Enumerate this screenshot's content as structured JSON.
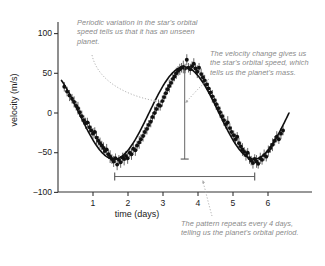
{
  "chart_data": {
    "type": "scatter",
    "title": "",
    "xlabel": "time (days)",
    "ylabel": "velocity (m/s)",
    "xlim": [
      0.1,
      6.6
    ],
    "ylim": [
      -100,
      115
    ],
    "xticks": [
      1,
      2,
      3,
      4,
      5,
      6
    ],
    "yticks": [
      100,
      50,
      0,
      -50,
      -100
    ],
    "xticklabels": [
      "1",
      "2",
      "3",
      "4",
      "5",
      "6"
    ],
    "yticklabels": [
      "100",
      "50",
      "0",
      "−50",
      "−100"
    ],
    "grid": false,
    "legend": null,
    "series": [
      {
        "name": "radial velocity measurements",
        "marker": "filled-circle-with-errorbars",
        "color": "#111111",
        "points": [
          {
            "x": 0.18,
            "y": 33,
            "err": 6
          },
          {
            "x": 0.26,
            "y": 27,
            "err": 6
          },
          {
            "x": 0.33,
            "y": 22,
            "err": 7
          },
          {
            "x": 0.4,
            "y": 18,
            "err": 6
          },
          {
            "x": 0.46,
            "y": 14,
            "err": 7
          },
          {
            "x": 0.52,
            "y": 9,
            "err": 6
          },
          {
            "x": 0.57,
            "y": 6,
            "err": 8
          },
          {
            "x": 0.62,
            "y": 1,
            "err": 6
          },
          {
            "x": 0.68,
            "y": -4,
            "err": 7
          },
          {
            "x": 0.74,
            "y": -9,
            "err": 6
          },
          {
            "x": 0.79,
            "y": -13,
            "err": 7
          },
          {
            "x": 0.84,
            "y": -12,
            "err": 6
          },
          {
            "x": 0.9,
            "y": -18,
            "err": 7
          },
          {
            "x": 0.95,
            "y": -22,
            "err": 6
          },
          {
            "x": 1.0,
            "y": -26,
            "err": 7
          },
          {
            "x": 1.05,
            "y": -24,
            "err": 6
          },
          {
            "x": 1.1,
            "y": -31,
            "err": 8
          },
          {
            "x": 1.15,
            "y": -35,
            "err": 6
          },
          {
            "x": 1.2,
            "y": -38,
            "err": 7
          },
          {
            "x": 1.25,
            "y": -41,
            "err": 6
          },
          {
            "x": 1.3,
            "y": -44,
            "err": 7
          },
          {
            "x": 1.34,
            "y": -48,
            "err": 6
          },
          {
            "x": 1.39,
            "y": -46,
            "err": 7
          },
          {
            "x": 1.44,
            "y": -52,
            "err": 6
          },
          {
            "x": 1.49,
            "y": -55,
            "err": 8
          },
          {
            "x": 1.54,
            "y": -58,
            "err": 6
          },
          {
            "x": 1.59,
            "y": -61,
            "err": 7
          },
          {
            "x": 1.64,
            "y": -57,
            "err": 6
          },
          {
            "x": 1.69,
            "y": -65,
            "err": 7
          },
          {
            "x": 1.74,
            "y": -59,
            "err": 6
          },
          {
            "x": 1.79,
            "y": -62,
            "err": 7
          },
          {
            "x": 1.84,
            "y": -56,
            "err": 6
          },
          {
            "x": 1.89,
            "y": -58,
            "err": 8
          },
          {
            "x": 1.94,
            "y": -54,
            "err": 6
          },
          {
            "x": 1.99,
            "y": -57,
            "err": 7
          },
          {
            "x": 2.05,
            "y": -50,
            "err": 6
          },
          {
            "x": 2.1,
            "y": -52,
            "err": 7
          },
          {
            "x": 2.15,
            "y": -45,
            "err": 6
          },
          {
            "x": 2.21,
            "y": -47,
            "err": 7
          },
          {
            "x": 2.26,
            "y": -41,
            "err": 6
          },
          {
            "x": 2.32,
            "y": -37,
            "err": 8
          },
          {
            "x": 2.37,
            "y": -33,
            "err": 6
          },
          {
            "x": 2.43,
            "y": -29,
            "err": 7
          },
          {
            "x": 2.48,
            "y": -24,
            "err": 6
          },
          {
            "x": 2.54,
            "y": -20,
            "err": 7
          },
          {
            "x": 2.59,
            "y": -15,
            "err": 6
          },
          {
            "x": 2.65,
            "y": -11,
            "err": 7
          },
          {
            "x": 2.7,
            "y": -5,
            "err": 6
          },
          {
            "x": 2.76,
            "y": 0,
            "err": 8
          },
          {
            "x": 2.81,
            "y": 5,
            "err": 6
          },
          {
            "x": 2.87,
            "y": 10,
            "err": 7
          },
          {
            "x": 2.92,
            "y": 9,
            "err": 6
          },
          {
            "x": 2.98,
            "y": 15,
            "err": 7
          },
          {
            "x": 3.03,
            "y": 20,
            "err": 6
          },
          {
            "x": 3.08,
            "y": 25,
            "err": 7
          },
          {
            "x": 3.13,
            "y": 30,
            "err": 6
          },
          {
            "x": 3.18,
            "y": 34,
            "err": 8
          },
          {
            "x": 3.23,
            "y": 38,
            "err": 6
          },
          {
            "x": 3.28,
            "y": 43,
            "err": 7
          },
          {
            "x": 3.33,
            "y": 46,
            "err": 6
          },
          {
            "x": 3.38,
            "y": 50,
            "err": 7
          },
          {
            "x": 3.43,
            "y": 53,
            "err": 6
          },
          {
            "x": 3.48,
            "y": 55,
            "err": 7
          },
          {
            "x": 3.53,
            "y": 57,
            "err": 6
          },
          {
            "x": 3.58,
            "y": 58,
            "err": 8
          },
          {
            "x": 3.63,
            "y": 56,
            "err": 6
          },
          {
            "x": 3.68,
            "y": 67,
            "err": 7
          },
          {
            "x": 3.73,
            "y": 57,
            "err": 6
          },
          {
            "x": 3.78,
            "y": 55,
            "err": 7
          },
          {
            "x": 3.83,
            "y": 59,
            "err": 6
          },
          {
            "x": 3.88,
            "y": 62,
            "err": 7
          },
          {
            "x": 3.93,
            "y": 56,
            "err": 6
          },
          {
            "x": 3.98,
            "y": 52,
            "err": 8
          },
          {
            "x": 4.03,
            "y": 57,
            "err": 6
          },
          {
            "x": 4.09,
            "y": 49,
            "err": 7
          },
          {
            "x": 4.14,
            "y": 45,
            "err": 6
          },
          {
            "x": 4.19,
            "y": 41,
            "err": 7
          },
          {
            "x": 4.25,
            "y": 36,
            "err": 6
          },
          {
            "x": 4.3,
            "y": 31,
            "err": 7
          },
          {
            "x": 4.36,
            "y": 26,
            "err": 6
          },
          {
            "x": 4.41,
            "y": 21,
            "err": 8
          },
          {
            "x": 4.47,
            "y": 16,
            "err": 6
          },
          {
            "x": 4.52,
            "y": 11,
            "err": 7
          },
          {
            "x": 4.58,
            "y": 6,
            "err": 6
          },
          {
            "x": 4.63,
            "y": 1,
            "err": 7
          },
          {
            "x": 4.69,
            "y": -4,
            "err": 6
          },
          {
            "x": 4.74,
            "y": -9,
            "err": 7
          },
          {
            "x": 4.8,
            "y": -14,
            "err": 6
          },
          {
            "x": 4.85,
            "y": -12,
            "err": 8
          },
          {
            "x": 4.91,
            "y": -19,
            "err": 6
          },
          {
            "x": 4.96,
            "y": -24,
            "err": 7
          },
          {
            "x": 5.02,
            "y": -28,
            "err": 6
          },
          {
            "x": 5.07,
            "y": -33,
            "err": 7
          },
          {
            "x": 5.12,
            "y": -30,
            "err": 6
          },
          {
            "x": 5.17,
            "y": -38,
            "err": 7
          },
          {
            "x": 5.22,
            "y": -42,
            "err": 6
          },
          {
            "x": 5.27,
            "y": -46,
            "err": 8
          },
          {
            "x": 5.32,
            "y": -49,
            "err": 6
          },
          {
            "x": 5.37,
            "y": -53,
            "err": 7
          },
          {
            "x": 5.42,
            "y": -50,
            "err": 6
          },
          {
            "x": 5.47,
            "y": -57,
            "err": 7
          },
          {
            "x": 5.52,
            "y": -60,
            "err": 6
          },
          {
            "x": 5.57,
            "y": -63,
            "err": 7
          },
          {
            "x": 5.62,
            "y": -58,
            "err": 6
          },
          {
            "x": 5.67,
            "y": -61,
            "err": 8
          },
          {
            "x": 5.72,
            "y": -64,
            "err": 6
          },
          {
            "x": 5.78,
            "y": -57,
            "err": 7
          },
          {
            "x": 5.83,
            "y": -59,
            "err": 6
          },
          {
            "x": 5.89,
            "y": -53,
            "err": 7
          },
          {
            "x": 5.95,
            "y": -55,
            "err": 6
          },
          {
            "x": 6.01,
            "y": -48,
            "err": 7
          },
          {
            "x": 6.07,
            "y": -44,
            "err": 6
          },
          {
            "x": 6.13,
            "y": -40,
            "err": 8
          },
          {
            "x": 6.19,
            "y": -35,
            "err": 6
          },
          {
            "x": 6.25,
            "y": -30,
            "err": 7
          },
          {
            "x": 6.31,
            "y": -33,
            "err": 6
          },
          {
            "x": 6.37,
            "y": -26,
            "err": 7
          },
          {
            "x": 6.43,
            "y": -22,
            "err": 6
          }
        ]
      }
    ],
    "fit_curve": {
      "name": "best-fit sinusoid",
      "amplitude": 58,
      "period_days": 4.0,
      "phase_peak_day": 3.6,
      "offset": 0,
      "color": "#111111"
    },
    "annotations": [
      {
        "id": "velocity-change-bar",
        "kind": "vertical-range-bar",
        "x": 3.62,
        "y_top": 58,
        "y_bottom": -58,
        "label": ""
      },
      {
        "id": "orbital-period-bar",
        "kind": "horizontal-range-bar",
        "x_start": 1.62,
        "x_end": 5.62,
        "y": -80,
        "label": ""
      }
    ]
  },
  "callouts": {
    "periodic_variation": "Periodic variation in the star's orbital speed tells us that it has an unseen planet.",
    "velocity_change": "The velocity change gives us the star's orbital speed, which tells us the planet's mass.",
    "pattern_repeats": "The pattern repeats every 4 days, telling us the planet's orbital period."
  },
  "colors": {
    "data": "#111111",
    "annotation_text": "#8a8a8a",
    "leader_line": "#aaaaaa",
    "axis": "#333333",
    "background": "#ffffff"
  }
}
